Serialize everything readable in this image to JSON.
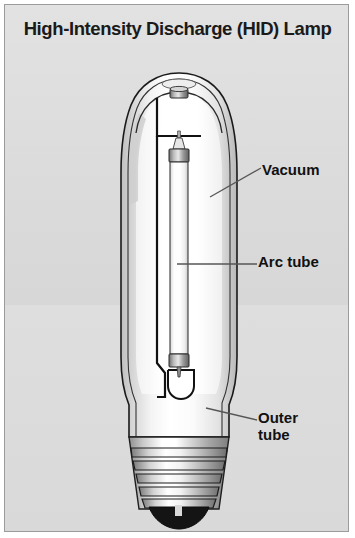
{
  "figure": {
    "title": "High-Intensity Discharge (HID) Lamp",
    "frame_border_color": "#9b9b9b",
    "plate_background_color": "#dcdcdc",
    "ink_color": "#111111",
    "leader_line_color": "#555555"
  },
  "labels": {
    "vacuum": "Vacuum",
    "arc_tube": "Arc tube",
    "outer_tube": "Outer\ntube"
  },
  "diagram": {
    "type": "cutaway-illustration",
    "subject": "High-Intensity Discharge (HID) lamp",
    "parts": [
      {
        "name": "outer tube",
        "description": "Elliptical glass envelope (bulb) shown in cutaway with double-line glass wall",
        "label": "Outer tube"
      },
      {
        "name": "vacuum",
        "description": "Evacuated space between the outer tube and the arc tube",
        "label": "Vacuum"
      },
      {
        "name": "arc tube",
        "description": "Narrow vertical inner discharge tube with metal end caps",
        "label": "Arc tube"
      },
      {
        "name": "support frame",
        "description": "Bent metal wire frame holding the arc tube inside the envelope",
        "label": ""
      },
      {
        "name": "exhaust tip",
        "description": "Small sealed nipple at the top centre of the dome",
        "label": ""
      },
      {
        "name": "screw base",
        "description": "Edison screw base with five thread ridges and dark bottom contact",
        "label": ""
      }
    ],
    "screw_thread_count": 5,
    "callouts": [
      {
        "label_key": "vacuum",
        "leader": "diagonal, from bulb wall up-right to text"
      },
      {
        "label_key": "arc_tube",
        "leader": "horizontal, from arc tube right to text"
      },
      {
        "label_key": "outer_tube",
        "leader": "diagonal, from bulb wall down-right to text"
      }
    ]
  }
}
